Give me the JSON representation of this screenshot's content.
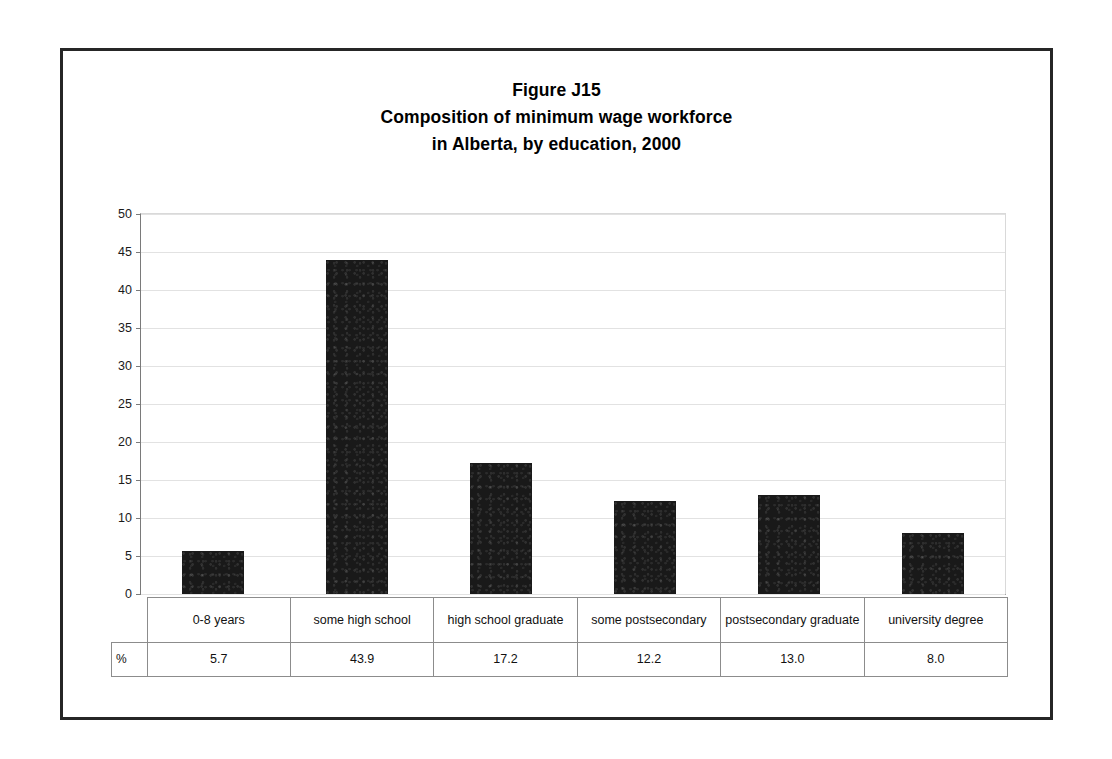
{
  "figure": {
    "title_lines": [
      "Figure J15",
      "Composition of minimum wage workforce",
      "in Alberta, by education, 2000"
    ],
    "unit_label": "%"
  },
  "chart_data": {
    "type": "bar",
    "title": "Figure J15 Composition of minimum wage workforce in Alberta, by education, 2000",
    "xlabel": "",
    "ylabel": "",
    "ylim": [
      0,
      50
    ],
    "yticks": [
      0,
      5,
      10,
      15,
      20,
      25,
      30,
      35,
      40,
      45,
      50
    ],
    "ytick_labels": [
      "0",
      "5",
      "10",
      "15",
      "20",
      "25",
      "30",
      "35",
      "40",
      "45",
      "50"
    ],
    "grid": true,
    "legend": "none",
    "categories": [
      "0-8 years",
      "some high school",
      "high school graduate",
      "some postsecondary",
      "postsecondary graduate",
      "university degree"
    ],
    "values": [
      5.7,
      43.9,
      17.2,
      12.2,
      13.0,
      8.0
    ],
    "value_labels": [
      "5.7",
      "43.9",
      "17.2",
      "12.2",
      "13.0",
      "8.0"
    ],
    "series_name": "%",
    "bar_color": "#191919"
  }
}
